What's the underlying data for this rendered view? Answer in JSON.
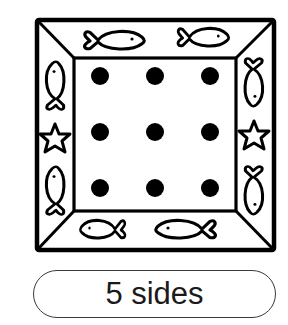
{
  "figure": {
    "frame": {
      "outer": {
        "x1": 37,
        "y1": 20,
        "x2": 274,
        "y2": 250
      },
      "inner": {
        "x1": 74,
        "y1": 58,
        "x2": 236,
        "y2": 211
      }
    },
    "dots": {
      "rows": 3,
      "cols": 3,
      "x": [
        100,
        155,
        210
      ],
      "y": [
        76,
        132,
        188
      ],
      "radius": 9,
      "color": "#000000"
    },
    "decorations": {
      "top": [
        "fish",
        "fish"
      ],
      "left": [
        "fish",
        "starfish",
        "fish"
      ],
      "right": [
        "fish",
        "starfish",
        "fish"
      ],
      "bottom": [
        "fish",
        "fish"
      ]
    }
  },
  "label": {
    "text": "5 sides"
  },
  "colors": {
    "ink": "#000000",
    "background": "#ffffff",
    "pill_border": "#3a3a3a"
  }
}
